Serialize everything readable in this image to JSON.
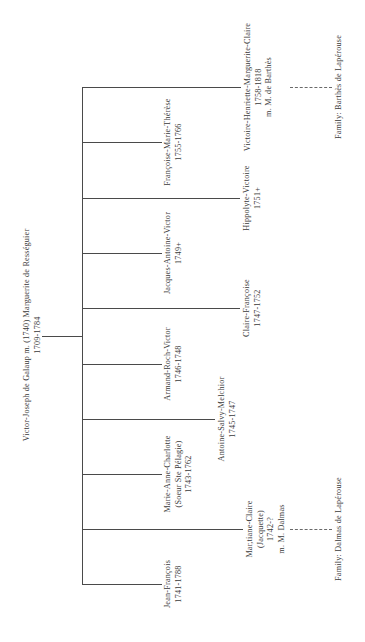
{
  "parent": {
    "line1": "Victor-Joseph de Galaup  m.  (1740) Marguerite de Rességuier",
    "line2": "1709-1784"
  },
  "children": [
    {
      "name": "Jean-François",
      "dates": "1741-1788"
    },
    {
      "name": "Mar,tiane-Claire",
      "alias": "(Jacquette)",
      "dates": "1742-?",
      "spouse": "m. M. Dalmas",
      "family": "Family: Dalmas de Lapérouse"
    },
    {
      "name": "Marie-Anne-Charlotte",
      "alias": "(Soeur Ste Pélagie)",
      "dates": "1743-1762"
    },
    {
      "name": "Antoine-Salvy-Melchior",
      "dates": "1745-1747"
    },
    {
      "name": "Armand-Roch-Victor",
      "dates": "1746-1748"
    },
    {
      "name": "Claire-Françoise",
      "dates": "1747-1752"
    },
    {
      "name": "Jacques-Antoine-Victor",
      "dates": "1749+"
    },
    {
      "name": "Hippolyte-Victoire",
      "dates": "1751+"
    },
    {
      "name": "Françoise-Marie-Thérèse",
      "dates": "1755-1766"
    },
    {
      "name": "Victoire-Henriette-Marguerite-Claire",
      "dates": "1758-1818",
      "spouse": "m. M. de Barthès",
      "family": "Family: Barthès de Lapérouse"
    }
  ]
}
